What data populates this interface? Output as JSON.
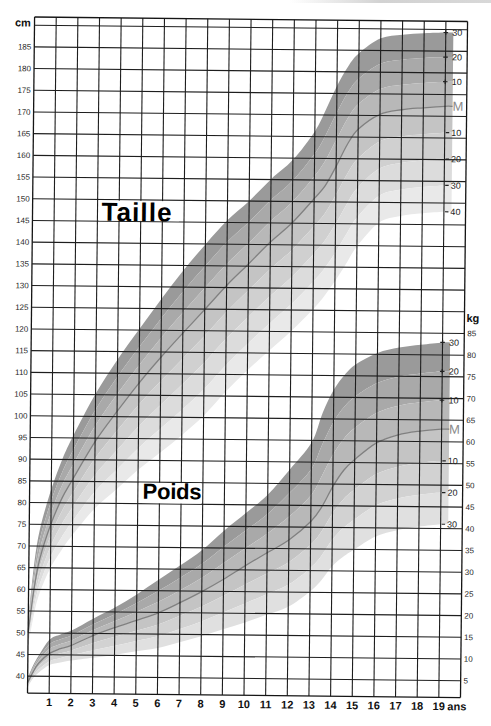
{
  "page": {
    "titles": {
      "taille": "Taille",
      "poids": "Poids"
    },
    "units": {
      "left": "cm",
      "right": "kg",
      "x": "ans"
    }
  },
  "chart_data": {
    "type": "line",
    "title": "",
    "xlabel": "ans",
    "ylabel": "cm",
    "ylabel_right": "kg",
    "xlim": [
      0,
      20
    ],
    "x_ticks": [
      1,
      2,
      3,
      4,
      5,
      6,
      7,
      8,
      9,
      10,
      11,
      12,
      13,
      14,
      15,
      16,
      17,
      18,
      19
    ],
    "ylim_left": [
      36,
      192
    ],
    "y_ticks_left": [
      185,
      180,
      175,
      170,
      165,
      160,
      155,
      150,
      145,
      140,
      135,
      130,
      125,
      120,
      115,
      110,
      105,
      100,
      95,
      90,
      85,
      80,
      75,
      70,
      65,
      60,
      55,
      50,
      45,
      40
    ],
    "y_ticks_right": [
      85,
      80,
      75,
      70,
      65,
      60,
      55,
      50,
      45,
      40,
      35,
      30,
      25,
      20,
      15,
      10,
      5
    ],
    "grid": true,
    "legend": "none",
    "x": [
      0,
      0.25,
      0.5,
      1,
      1.5,
      2,
      3,
      4,
      5,
      6,
      7,
      8,
      9,
      10,
      11,
      12,
      13,
      13.5,
      14,
      14.5,
      15,
      16,
      17,
      18,
      19,
      19.35
    ],
    "series": [
      {
        "name": "Taille",
        "unit": "cm",
        "axis": "left",
        "median": [
          50,
          60,
          67,
          75.1,
          81.1,
          85.6,
          94.2,
          101.2,
          107.8,
          113.8,
          119.4,
          124.9,
          130.5,
          135.5,
          140.6,
          145.1,
          150.7,
          153.7,
          158.2,
          163.2,
          166.8,
          170.3,
          171.4,
          171.9,
          172.3,
          172.3
        ],
        "upper_edge_plus3": [
          53,
          66,
          74,
          83.1,
          90.1,
          95.6,
          105.2,
          113.2,
          120.3,
          127.3,
          133.9,
          139.9,
          145.5,
          150,
          155.1,
          159.6,
          166.2,
          171.2,
          176.7,
          181.2,
          184.3,
          187.8,
          188.7,
          189.1,
          189.3,
          189.3
        ],
        "lower_edge": [
          47,
          54,
          59,
          65,
          69.1,
          72.6,
          78.7,
          83.2,
          87.8,
          91.8,
          95.9,
          100.4,
          106,
          111,
          115.6,
          120.1,
          125.2,
          128.2,
          131.7,
          135.7,
          139.8,
          145.3,
          146.9,
          147.6,
          148,
          148
        ],
        "levels_above": 3,
        "levels_below": 4,
        "curve_labels": [
          {
            "level": 3,
            "sign": "+",
            "text": "30"
          },
          {
            "level": 2,
            "sign": "+",
            "text": "20"
          },
          {
            "level": 1,
            "sign": "+",
            "text": "10"
          },
          {
            "level": 0,
            "sign": "",
            "text": "M"
          },
          {
            "level": -1,
            "sign": "-",
            "text": "10"
          },
          {
            "level": -2,
            "sign": "-",
            "text": "20"
          },
          {
            "level": -3,
            "sign": "-",
            "text": "30"
          },
          {
            "level": -4,
            "sign": "-",
            "text": "40"
          }
        ],
        "band_colors": [
          "#9a9a9a",
          "#a9a9a9",
          "#b8b8b8",
          "#c4c4c4",
          "#d0d0d0",
          "#dcdcdc",
          "#e9e9e9"
        ],
        "median_color": "#808080"
      },
      {
        "name": "Poids",
        "unit": "kg",
        "axis": "right",
        "median": [
          3.5,
          6,
          8,
          10.3,
          11.4,
          12.2,
          14.5,
          16.4,
          18.1,
          19.9,
          22.3,
          24.9,
          27.8,
          31,
          34,
          37,
          41.3,
          44.7,
          49.4,
          53.2,
          55.7,
          59.6,
          61.5,
          62.4,
          62.9,
          62.9
        ],
        "upper_edge_plus3": [
          4.5,
          7.5,
          9.8,
          13.5,
          14.7,
          15.6,
          18.4,
          21,
          24.1,
          27.5,
          30.9,
          34.5,
          39,
          43.1,
          47.4,
          53.2,
          59.5,
          66.4,
          71.7,
          75.2,
          77.6,
          80.3,
          81.6,
          82.3,
          82.9,
          82.9
        ],
        "lower_edge": [
          2.5,
          4.5,
          5.8,
          7.6,
          8.2,
          8.7,
          9.4,
          10.1,
          11,
          11.8,
          13.2,
          14.6,
          16.3,
          17.9,
          19.7,
          21.6,
          25.2,
          27.7,
          31,
          33.2,
          34.9,
          38,
          39.5,
          40.4,
          41,
          41
        ],
        "levels_above": 3,
        "levels_below": 3,
        "curve_labels": [
          {
            "level": 3,
            "sign": "+",
            "text": "30"
          },
          {
            "level": 2,
            "sign": "+",
            "text": "20"
          },
          {
            "level": 1,
            "sign": "+",
            "text": "10"
          },
          {
            "level": 0,
            "sign": "",
            "text": "M"
          },
          {
            "level": -1,
            "sign": "-",
            "text": "10"
          },
          {
            "level": -2,
            "sign": "-",
            "text": "20"
          },
          {
            "level": -3,
            "sign": "-",
            "text": "30"
          }
        ],
        "band_colors": [
          "#9a9a9a",
          "#a9a9a9",
          "#b8b8b8",
          "#c4c4c4",
          "#d2d2d2",
          "#e0e0e0"
        ],
        "median_color": "#808080"
      }
    ]
  }
}
